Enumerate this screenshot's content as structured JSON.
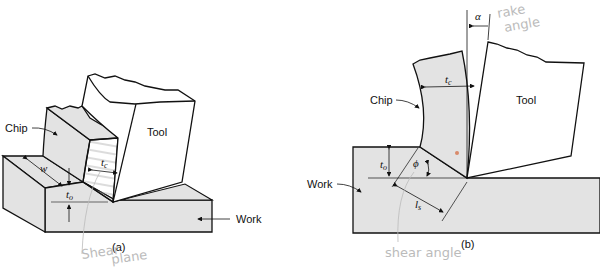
{
  "figure_a": {
    "caption": "(a)",
    "labels": {
      "chip": "Chip",
      "tool": "Tool",
      "work": "Work",
      "w": "w",
      "tc": "t",
      "tc_sub": "c",
      "to": "t",
      "to_sub": "o"
    },
    "handwritten": [
      "Shear",
      "plane"
    ]
  },
  "figure_b": {
    "caption": "(b)",
    "labels": {
      "chip": "Chip",
      "tool": "Tool",
      "work": "Work",
      "alpha": "α",
      "phi": "ϕ",
      "tc": "t",
      "tc_sub": "c",
      "to": "t",
      "to_sub": "o",
      "ls": "l",
      "ls_sub": "s"
    },
    "handwritten": {
      "rake": [
        "rake",
        "angle"
      ],
      "shear": "shear angle"
    }
  },
  "colors": {
    "material_fill": "#e3e3e3",
    "outline": "#111111",
    "handwriting": "#bbbbbb",
    "tool_fill": "#ffffff"
  }
}
